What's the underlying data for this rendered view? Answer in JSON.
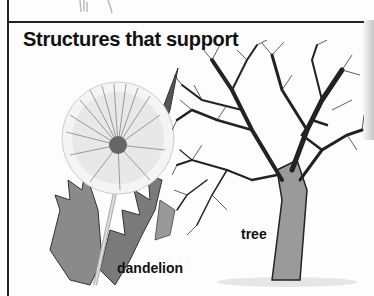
{
  "section": {
    "heading": "Structures that support"
  },
  "figures": [
    {
      "name": "dandelion",
      "label": "dandelion"
    },
    {
      "name": "tree",
      "label": "tree"
    }
  ],
  "colors": {
    "ink": "#111111",
    "rule": "#222222",
    "paper": "#fdfdfd"
  }
}
